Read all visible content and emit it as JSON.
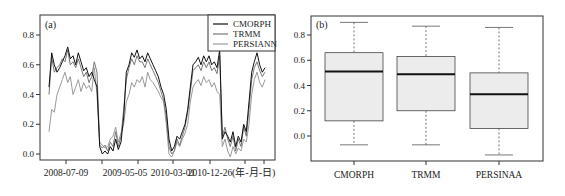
{
  "chart_data": [
    {
      "type": "line",
      "panel_label": "(a)",
      "title": "",
      "xlabel": "(年-月-日)",
      "ylabel": "",
      "ylim": [
        -0.02,
        0.92
      ],
      "yticks": [
        0.0,
        0.2,
        0.4,
        0.6,
        0.8
      ],
      "xtick_labels": [
        "2008-07-09",
        "2009-05-05",
        "2010-03-01",
        "2010-12-26"
      ],
      "grid": false,
      "legend_position": "upper right",
      "legend": [
        "CMORPH",
        "TRMM",
        "PERSIANN"
      ],
      "series": [
        {
          "name": "CMORPH",
          "color": "#111111",
          "values": [
            0.45,
            0.68,
            0.6,
            0.55,
            0.58,
            0.62,
            0.66,
            0.72,
            0.64,
            0.66,
            0.6,
            0.68,
            0.62,
            0.56,
            0.58,
            0.52,
            0.55,
            0.5,
            0.45,
            0.05,
            0.0,
            0.02,
            0.0,
            0.05,
            0.02,
            0.1,
            0.03,
            0.08,
            0.25,
            0.55,
            0.6,
            0.68,
            0.65,
            0.7,
            0.64,
            0.66,
            0.62,
            0.68,
            0.64,
            0.6,
            0.56,
            0.52,
            0.45,
            0.4,
            0.3,
            0.1,
            0.02,
            0.05,
            0.12,
            0.1,
            0.15,
            0.2,
            0.3,
            0.45,
            0.6,
            0.62,
            0.65,
            0.6,
            0.66,
            0.62,
            0.66,
            0.6,
            0.62,
            0.58,
            0.7,
            0.1,
            0.15,
            0.12,
            0.08,
            0.15,
            0.05,
            0.12,
            0.08,
            0.2,
            0.15,
            0.35,
            0.55,
            0.62,
            0.68,
            0.6,
            0.55,
            0.58
          ]
        },
        {
          "name": "TRMM",
          "color": "#777777",
          "values": [
            0.4,
            0.65,
            0.55,
            0.58,
            0.6,
            0.64,
            0.62,
            0.7,
            0.6,
            0.62,
            0.58,
            0.64,
            0.58,
            0.52,
            0.55,
            0.48,
            0.52,
            0.62,
            0.55,
            0.06,
            0.04,
            0.06,
            0.02,
            0.08,
            0.05,
            0.15,
            0.05,
            0.12,
            0.3,
            0.5,
            0.58,
            0.64,
            0.6,
            0.66,
            0.62,
            0.62,
            0.58,
            0.64,
            0.6,
            0.56,
            0.52,
            0.48,
            0.42,
            0.36,
            0.25,
            0.05,
            0.0,
            0.02,
            0.1,
            0.06,
            0.12,
            0.18,
            0.28,
            0.42,
            0.56,
            0.58,
            0.6,
            0.56,
            0.62,
            0.58,
            0.62,
            0.56,
            0.58,
            0.54,
            0.66,
            0.12,
            0.18,
            0.1,
            0.05,
            0.12,
            0.02,
            0.1,
            0.05,
            0.18,
            0.12,
            0.3,
            0.5,
            0.58,
            0.62,
            0.56,
            0.52,
            0.55
          ]
        },
        {
          "name": "PERSIANN",
          "color": "#9a9a9a",
          "values": [
            0.15,
            0.3,
            0.28,
            0.4,
            0.45,
            0.5,
            0.55,
            0.48,
            0.52,
            0.4,
            0.45,
            0.5,
            0.42,
            0.48,
            0.44,
            0.46,
            0.42,
            0.58,
            0.4,
            0.08,
            0.06,
            0.04,
            0.05,
            0.1,
            0.12,
            0.18,
            0.08,
            0.14,
            0.2,
            0.35,
            0.4,
            0.48,
            0.45,
            0.5,
            0.48,
            0.52,
            0.45,
            0.55,
            0.5,
            0.48,
            0.45,
            0.42,
            0.38,
            0.35,
            0.2,
            0.0,
            -0.02,
            0.02,
            0.08,
            0.05,
            0.1,
            0.14,
            0.2,
            0.35,
            0.45,
            0.48,
            0.5,
            0.46,
            0.52,
            0.48,
            0.5,
            0.45,
            0.48,
            0.42,
            0.4,
            0.05,
            0.1,
            0.02,
            -0.02,
            0.05,
            0.0,
            0.04,
            0.02,
            0.1,
            0.08,
            0.2,
            0.4,
            0.5,
            0.55,
            0.48,
            0.45,
            0.5
          ]
        }
      ]
    },
    {
      "type": "box",
      "panel_label": "(b)",
      "title": "",
      "xlabel": "",
      "ylabel": "",
      "ylim": [
        -0.18,
        0.95
      ],
      "yticks": [
        0.0,
        0.2,
        0.4,
        0.6,
        0.8
      ],
      "grid": false,
      "categories": [
        "CMORPH",
        "TRMM",
        "PERSINAA"
      ],
      "series": [
        {
          "name": "CMORPH",
          "whisker_high": 0.9,
          "q3": 0.66,
          "median": 0.51,
          "q1": 0.12,
          "whisker_low": -0.07
        },
        {
          "name": "TRMM",
          "whisker_high": 0.87,
          "q3": 0.63,
          "median": 0.49,
          "q1": 0.2,
          "whisker_low": -0.07
        },
        {
          "name": "PERSINAA",
          "whisker_high": 0.86,
          "q3": 0.5,
          "median": 0.33,
          "q1": 0.06,
          "whisker_low": -0.15
        }
      ]
    }
  ],
  "panel_a": {
    "label": "(a)",
    "yticks": [
      "0.8",
      "0.6",
      "0.4",
      "0.2",
      "0.0"
    ],
    "xticks": [
      "2008-07-09",
      "2009-05-05",
      "2010-03-01",
      "2010-12-26"
    ],
    "xunit": "(年-月-日)",
    "legend": [
      "CMORPH",
      "TRMM",
      "PERSIANN"
    ]
  },
  "panel_b": {
    "label": "(b)",
    "yticks": [
      "0.8",
      "0.6",
      "0.4",
      "0.2",
      "0.0"
    ],
    "categories": [
      "CMORPH",
      "TRMM",
      "PERSINAA"
    ]
  }
}
